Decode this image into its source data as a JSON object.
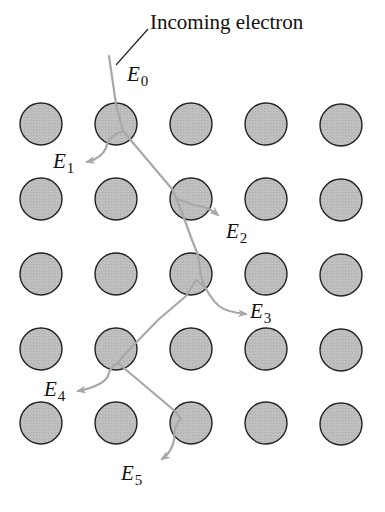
{
  "title": "Incoming electron",
  "energy_labels": [
    {
      "id": "E0",
      "base": "E",
      "sub": "0",
      "x": 127,
      "y": 81
    },
    {
      "id": "E1",
      "base": "E",
      "sub": "1",
      "x": 53,
      "y": 168
    },
    {
      "id": "E2",
      "base": "E",
      "sub": "2",
      "x": 226,
      "y": 238
    },
    {
      "id": "E3",
      "base": "E",
      "sub": "3",
      "x": 250,
      "y": 318
    },
    {
      "id": "E4",
      "base": "E",
      "sub": "4",
      "x": 44,
      "y": 396
    },
    {
      "id": "E5",
      "base": "E",
      "sub": "5",
      "x": 121,
      "y": 480
    }
  ],
  "lattice": {
    "cols": [
      41,
      116,
      191,
      266,
      341
    ],
    "rows": [
      124,
      199,
      274,
      349,
      423
    ],
    "radius": 21,
    "fill": "#bdbdbd",
    "stroke": "#222222"
  },
  "colors": {
    "path": "#a8a8a8",
    "leader": "#222222"
  }
}
